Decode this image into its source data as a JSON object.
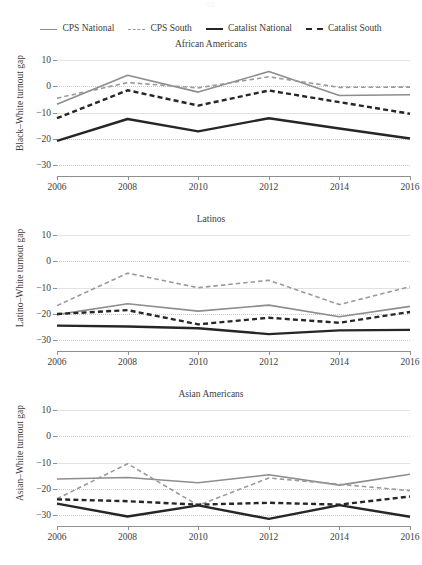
{
  "legend": {
    "items": [
      {
        "label": "CPS National",
        "key": "cps_national",
        "style": "solid",
        "color": "#8d8d8d",
        "width": 1.6
      },
      {
        "label": "CPS South",
        "key": "cps_south",
        "style": "dashed",
        "color": "#9a9a9a",
        "width": 1.6
      },
      {
        "label": "Catalist National",
        "key": "catalist_national",
        "style": "solid",
        "color": "#262626",
        "width": 2.4
      },
      {
        "label": "Catalist South",
        "key": "catalist_south",
        "style": "dashed",
        "color": "#262626",
        "width": 2.4
      }
    ]
  },
  "axis": {
    "yticks": [
      10,
      0,
      -10,
      -20,
      -30
    ],
    "ylim": [
      -34,
      13
    ],
    "xticks": [
      2006,
      2008,
      2010,
      2012,
      2014,
      2016
    ],
    "xlim": [
      2006,
      2016
    ],
    "grid": true
  },
  "chart_data": [
    {
      "type": "line",
      "title": "African Americans",
      "xlabel": "",
      "ylabel": "Black–White turnout gap",
      "x": [
        2006,
        2008,
        2010,
        2012,
        2014,
        2016
      ],
      "xticklabels": [
        "2006",
        "2008",
        "2010",
        "2012",
        "2014",
        "2016"
      ],
      "yticklabels": [
        "10",
        "0",
        "−10",
        "−20",
        "−30"
      ],
      "ylim": [
        -34,
        13
      ],
      "series": [
        {
          "name": "CPS National",
          "color": "#8d8d8d",
          "style": "solid",
          "width": 1.6,
          "values": [
            -6.8,
            4.2,
            -2.2,
            5.6,
            -3.5,
            -3.2
          ]
        },
        {
          "name": "CPS South",
          "color": "#9a9a9a",
          "style": "dashed",
          "width": 1.6,
          "values": [
            -4.5,
            1.4,
            -0.6,
            3.6,
            -0.4,
            -0.3
          ]
        },
        {
          "name": "Catalist National",
          "color": "#262626",
          "style": "solid",
          "width": 2.4,
          "values": [
            -20.7,
            -12.4,
            -17.1,
            -12.1,
            -16.0,
            -19.8
          ]
        },
        {
          "name": "Catalist South",
          "color": "#262626",
          "style": "dashed",
          "width": 2.4,
          "values": [
            -12.1,
            -1.5,
            -7.3,
            -1.6,
            -6.0,
            -10.4
          ]
        }
      ]
    },
    {
      "type": "line",
      "title": "Latinos",
      "xlabel": "",
      "ylabel": "Latino–White turnout gap",
      "x": [
        2006,
        2008,
        2010,
        2012,
        2014,
        2016
      ],
      "xticklabels": [
        "2006",
        "2008",
        "2010",
        "2012",
        "2014",
        "2016"
      ],
      "yticklabels": [
        "10",
        "0",
        "−10",
        "−20",
        "−30"
      ],
      "ylim": [
        -34,
        13
      ],
      "series": [
        {
          "name": "CPS National",
          "color": "#8d8d8d",
          "style": "solid",
          "width": 1.6,
          "values": [
            -20.2,
            -16.1,
            -18.9,
            -16.6,
            -21.0,
            -17.1
          ]
        },
        {
          "name": "CPS South",
          "color": "#9a9a9a",
          "style": "dashed",
          "width": 1.6,
          "values": [
            -16.8,
            -4.5,
            -10.0,
            -7.2,
            -16.4,
            -9.6
          ]
        },
        {
          "name": "Catalist National",
          "color": "#262626",
          "style": "solid",
          "width": 2.4,
          "values": [
            -24.4,
            -24.7,
            -25.4,
            -27.6,
            -26.2,
            -26.0
          ]
        },
        {
          "name": "Catalist South",
          "color": "#262626",
          "style": "dashed",
          "width": 2.4,
          "values": [
            -20.0,
            -18.5,
            -23.9,
            -21.4,
            -23.3,
            -19.2
          ]
        }
      ]
    },
    {
      "type": "line",
      "title": "Asian Americans",
      "xlabel": "",
      "ylabel": "Asian–White turnout gap",
      "x": [
        2006,
        2008,
        2010,
        2012,
        2014,
        2016
      ],
      "xticklabels": [
        "2006",
        "2008",
        "2010",
        "2012",
        "2014",
        "2016"
      ],
      "yticklabels": [
        "10",
        "0",
        "−10",
        "−20",
        "−30"
      ],
      "ylim": [
        -34,
        13
      ],
      "series": [
        {
          "name": "CPS National",
          "color": "#8d8d8d",
          "style": "solid",
          "width": 1.6,
          "values": [
            -16.2,
            -15.6,
            -17.6,
            -14.6,
            -18.5,
            -14.4
          ]
        },
        {
          "name": "CPS South",
          "color": "#9a9a9a",
          "style": "dashed",
          "width": 1.6,
          "values": [
            -23.7,
            -10.4,
            -26.2,
            -15.8,
            -18.2,
            -20.6
          ]
        },
        {
          "name": "Catalist National",
          "color": "#262626",
          "style": "solid",
          "width": 2.4,
          "values": [
            -25.5,
            -30.4,
            -26.2,
            -31.3,
            -26.1,
            -30.5
          ]
        },
        {
          "name": "Catalist South",
          "color": "#262626",
          "style": "dashed",
          "width": 2.4,
          "values": [
            -23.9,
            -24.6,
            -25.9,
            -25.2,
            -25.9,
            -22.8
          ]
        }
      ]
    }
  ]
}
